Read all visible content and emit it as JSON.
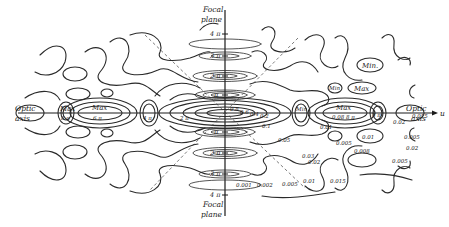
{
  "figure": {
    "type": "contour-diagram",
    "axes": {
      "vertical": {
        "label_top": [
          "Focal",
          "plane"
        ],
        "label_bottom": [
          "4 π",
          "Focal",
          "plane"
        ],
        "ticks_top": [
          "4 π",
          "3 π",
          "2 π",
          "π"
        ],
        "ticks_bottom": [
          "π",
          "2 π",
          "3 π"
        ]
      },
      "horizontal": {
        "label_left": [
          "Optic",
          "axis"
        ],
        "label_right": [
          "Optic",
          "axis"
        ],
        "variable": "u"
      }
    },
    "region_labels": {
      "left": [
        {
          "text": "Max",
          "sub": "8 π"
        },
        {
          "text": "Max",
          "sub": "6 π"
        },
        {
          "text": "4 π"
        },
        {
          "text": "2 π"
        }
      ],
      "right": [
        {
          "text": "Max",
          "sub": "0.08  8 π"
        },
        {
          "text": "Min."
        },
        {
          "text": "Min"
        },
        {
          "text": "Max"
        },
        {
          "text": "Min"
        },
        {
          "text": "8 π"
        }
      ]
    },
    "contour_values": [
      "0.8",
      "0.6",
      "0.4",
      "0.2",
      "0.1",
      "0.05",
      "0.03",
      "0.02",
      "0.01",
      "0.005",
      "0.015",
      "0.008",
      "0.001",
      "0.002",
      "0.005",
      "0.01",
      "0.015",
      "0.02",
      "0.01",
      "0.005",
      "0.008",
      "0.01",
      "0.005",
      "0.02",
      "0.015"
    ],
    "labels_text": {
      "center_vals": [
        "0.8",
        "0.6",
        "0.4",
        "0.2"
      ],
      "right_near": [
        "0.1",
        "0.05",
        "0.03",
        "0.02"
      ],
      "right_mid": [
        "0.01",
        "0.005",
        "0.01",
        "0.008"
      ],
      "right_far": [
        "0.02",
        "0.005",
        "0.015",
        "0.02",
        "0.005"
      ],
      "bottom_row": [
        "0.001",
        "0.002",
        "0.005",
        "0.01",
        "0.015"
      ],
      "upper_right": [
        "Min.",
        "Min",
        "Max"
      ]
    },
    "colors": {
      "ink": "#2a2a2a",
      "paper": "#ffffff"
    }
  }
}
